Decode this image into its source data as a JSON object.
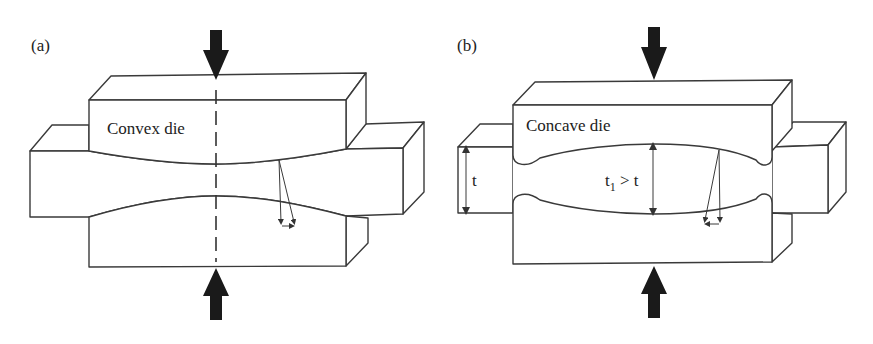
{
  "figure": {
    "panels": [
      {
        "id": "a",
        "label": "(a)",
        "die_label": "Convex die",
        "die_type": "convex"
      },
      {
        "id": "b",
        "label": "(b)",
        "die_label": "Concave die",
        "die_type": "concave",
        "dimension_t": "t",
        "dimension_t1_main": "t",
        "dimension_t1_sub": "1",
        "dimension_t1_rest": " > t"
      }
    ],
    "colors": {
      "line": "#3a3a3a",
      "arrow": "#1a1a1a",
      "background": "#ffffff"
    }
  }
}
